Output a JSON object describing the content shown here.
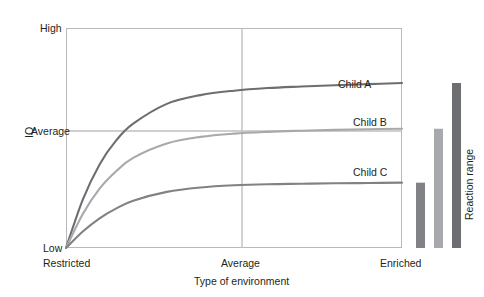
{
  "figure": {
    "background_color": "#ffffff",
    "text_color": "#231f20",
    "frame_color": "#b9b9bb",
    "gridline_color": "#bfbfc1"
  },
  "axes": {
    "x_axis_title": "Type of environment",
    "y_axis_title": "IQ",
    "x_tick_labels": [
      "Restricted",
      "Average",
      "Enriched"
    ],
    "y_tick_labels": [
      "High",
      "Average",
      "Low"
    ]
  },
  "series_labels": {
    "child_a": "Child A",
    "child_b": "Child B",
    "child_c": "Child C"
  },
  "reaction_range": {
    "label": "Reaction range"
  },
  "chart_data": {
    "type": "line",
    "title": "",
    "subtitle": "",
    "xlabel": "Type of environment",
    "ylabel": "IQ",
    "x_tick_labels": [
      "Restricted",
      "Average",
      "Enriched"
    ],
    "y_tick_labels": [
      "Low",
      "Average",
      "High"
    ],
    "xlim": [
      0,
      1
    ],
    "ylim": [
      0,
      1
    ],
    "grid": true,
    "gridlines": {
      "vertical_at": [
        "Average"
      ],
      "horizontal_at": [
        "Average"
      ]
    },
    "legend_position": "inline-right-of-curves",
    "annotations": [
      {
        "text": "Child A",
        "x": 0.83,
        "y": 0.74
      },
      {
        "text": "Child B",
        "x": 0.83,
        "y": 0.58
      },
      {
        "text": "Child C",
        "x": 0.83,
        "y": 0.33
      },
      {
        "text": "Reaction range",
        "x": 1.12,
        "y": 0.42,
        "rotation": 90
      }
    ],
    "series": [
      {
        "name": "Child A",
        "color": "#6d6e71",
        "x": [
          0.0,
          0.05,
          0.1,
          0.15,
          0.2,
          0.3,
          0.4,
          0.5,
          0.6,
          0.7,
          0.8,
          0.9,
          1.0
        ],
        "y": [
          0.0,
          0.22,
          0.38,
          0.49,
          0.565,
          0.655,
          0.695,
          0.715,
          0.727,
          0.734,
          0.74,
          0.745,
          0.75
        ]
      },
      {
        "name": "Child B",
        "color": "#a7a9ac",
        "x": [
          0.0,
          0.05,
          0.1,
          0.15,
          0.2,
          0.3,
          0.4,
          0.5,
          0.6,
          0.7,
          0.8,
          0.9,
          1.0
        ],
        "y": [
          0.0,
          0.155,
          0.27,
          0.35,
          0.41,
          0.475,
          0.505,
          0.52,
          0.528,
          0.533,
          0.537,
          0.54,
          0.542
        ]
      },
      {
        "name": "Child C",
        "color": "#808285",
        "x": [
          0.0,
          0.05,
          0.1,
          0.15,
          0.2,
          0.3,
          0.4,
          0.5,
          0.6,
          0.7,
          0.8,
          0.9,
          1.0
        ],
        "y": [
          0.0,
          0.075,
          0.135,
          0.18,
          0.215,
          0.255,
          0.275,
          0.285,
          0.29,
          0.292,
          0.294,
          0.2955,
          0.297
        ]
      }
    ],
    "reaction_range_bars": [
      {
        "name": "Child C",
        "color": "#808285",
        "bottom": 0.0,
        "top": 0.297
      },
      {
        "name": "Child B",
        "color": "#a7a9ac",
        "bottom": 0.0,
        "top": 0.542
      },
      {
        "name": "Child A",
        "color": "#6d6e71",
        "bottom": 0.0,
        "top": 0.75
      }
    ]
  }
}
